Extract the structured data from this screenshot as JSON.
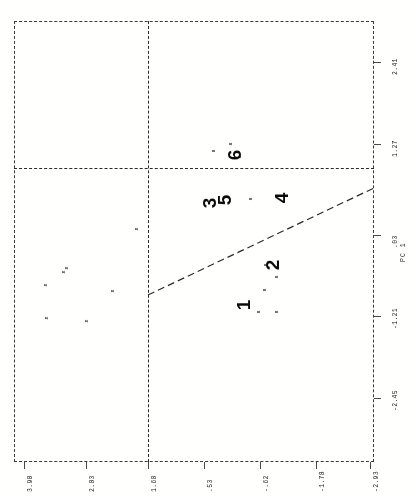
{
  "figure": {
    "orientation": "rotated-90-ccw",
    "background": "#fdfdfc",
    "ink_color": "#1d1d1d"
  },
  "chart_data": {
    "type": "scatter",
    "title": "",
    "xlabel": "PC 1",
    "ylabel": "",
    "axis_title_right": "PC 1",
    "grid": false,
    "legend": "none",
    "x_ticks_bottom": [
      "3.98",
      "2.83",
      "1.68",
      ".53",
      "-.62",
      "-1.78",
      "-2.93"
    ],
    "y_ticks_right": [
      "2.41",
      "1.27",
      ".03",
      "-1.21",
      "-2.45"
    ],
    "xlim": [
      -2.93,
      3.98
    ],
    "ylim": [
      -2.45,
      2.41
    ],
    "reference_lines": [
      {
        "name": "vertical-divider",
        "style": "dashed",
        "orientation": "vertical",
        "value": 1.68
      },
      {
        "name": "horizontal-divider",
        "style": "dashed",
        "orientation": "horizontal",
        "value": 1.27
      },
      {
        "name": "discriminant-line",
        "style": "dashed",
        "orientation": "diagonal"
      }
    ],
    "series": [
      {
        "name": "group-x",
        "marker": "x",
        "points": [
          [
            3.05,
            -0.6
          ],
          [
            2.78,
            -0.92
          ],
          [
            2.62,
            -0.53
          ],
          [
            2.3,
            -0.79
          ],
          [
            1.95,
            -1.12
          ],
          [
            1.72,
            -1.35
          ],
          [
            1.7,
            0.17
          ]
        ]
      },
      {
        "name": "group-s",
        "marker": "s",
        "points": [
          [
            -0.05,
            -1.02
          ],
          [
            -0.3,
            -1.18
          ],
          [
            -0.46,
            -1.3
          ],
          [
            -0.52,
            -1.08
          ],
          [
            -0.66,
            -1.4
          ],
          [
            0.38,
            0.62
          ],
          [
            0.52,
            0.45
          ],
          [
            0.9,
            1.25
          ],
          [
            1.02,
            1.38
          ],
          [
            0.22,
            1.12
          ]
        ]
      }
    ],
    "cluster_labels": [
      {
        "label": "1",
        "x": 243,
        "y": 305
      },
      {
        "label": "2",
        "x": 272,
        "y": 265
      },
      {
        "label": "3",
        "x": 209,
        "y": 203
      },
      {
        "label": "5",
        "x": 224,
        "y": 200
      },
      {
        "label": "4",
        "x": 281,
        "y": 198
      },
      {
        "label": "6",
        "x": 234,
        "y": 155
      }
    ]
  },
  "markers": {
    "x_glyph": "x",
    "s_glyph": "s"
  },
  "point_positions_px": {
    "x_markers": [
      [
        46,
        285
      ],
      [
        64,
        272
      ],
      [
        47,
        318
      ],
      [
        67,
        268
      ],
      [
        87,
        321
      ],
      [
        113,
        291
      ],
      [
        137,
        229
      ]
    ],
    "s_markers": [
      [
        266,
        265
      ],
      [
        277,
        277
      ],
      [
        265,
        290
      ],
      [
        259,
        312
      ],
      [
        277,
        312
      ],
      [
        251,
        199
      ],
      [
        240,
        157
      ],
      [
        214,
        151
      ],
      [
        231,
        144
      ]
    ]
  },
  "tick_positions_px": {
    "bottom": [
      {
        "label": "3.98",
        "x": 24
      },
      {
        "label": "2.83",
        "x": 86
      },
      {
        "label": "1.68",
        "x": 148
      },
      {
        "label": ".53",
        "x": 204
      },
      {
        "label": "-.62",
        "x": 260
      },
      {
        "label": "-1.78",
        "x": 316
      },
      {
        "label": "-2.93",
        "x": 370
      }
    ],
    "right": [
      {
        "label": "2.41",
        "y": 62
      },
      {
        "label": "1.27",
        "y": 144
      },
      {
        "label": ".03",
        "y": 235
      },
      {
        "label": "-1.21",
        "y": 316
      },
      {
        "label": "-2.45",
        "y": 398
      }
    ],
    "axis_title": {
      "label": "PC 1",
      "y": 250
    }
  }
}
